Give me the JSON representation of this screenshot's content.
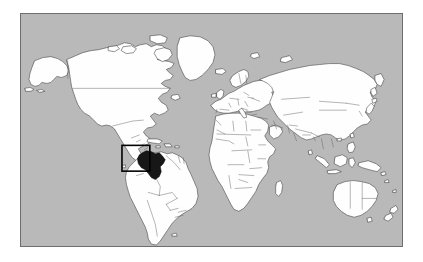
{
  "figure": {
    "type": "world-locator-map",
    "title": "",
    "caption": ""
  },
  "map": {
    "projection_label": "equirectangular",
    "ocean_color": "#b9b9b9",
    "land_color": "#fefefe",
    "border_color": "#5a5a5a",
    "coast_color": "#3a3a3a",
    "frame_color": "#6e6e6e",
    "frame": {
      "left": 20,
      "top": 13,
      "width": 383,
      "height": 234
    },
    "lon_range": [
      -180,
      180
    ],
    "lat_range": [
      -58,
      84
    ]
  },
  "highlight": {
    "country_name": "Colombia",
    "fill_color": "#171717",
    "label": ""
  },
  "locator_box": {
    "stroke_color": "#000000",
    "left": 121,
    "top": 145,
    "width": 28,
    "height": 26,
    "label": ""
  },
  "chart_data": {
    "type": "map",
    "title": "",
    "highlighted_regions": [
      "Colombia"
    ],
    "legend": [],
    "annotations": []
  }
}
